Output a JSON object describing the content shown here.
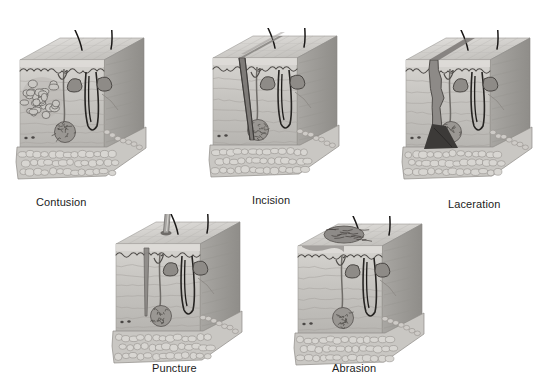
{
  "figure": {
    "background_color": "#ffffff",
    "style": "grayscale medical illustration",
    "palette": {
      "epidermis_top": "#d2d0cd",
      "epidermis_shadow": "#b4b2af",
      "dermis_light": "#cdcbc7",
      "dermis_mid": "#bab8b4",
      "dermis_dark": "#a3a09c",
      "hypodermis": "#c9c7c3",
      "hypodermis_outline": "#8e8b87",
      "hair_dark": "#222222",
      "gland_dark": "#6f6c68",
      "wound_dark": "#4a4745",
      "nail_metal": "#a8a6a3",
      "label_text": "#1c1c1c"
    }
  },
  "wounds": [
    {
      "id": "contusion",
      "label": "Contusion",
      "row": 1,
      "column": 1,
      "block_x": 12,
      "block_y": 30,
      "label_x": 36,
      "label_y": 196,
      "wound_feature": "bruise",
      "description": "Cluster of pooled blood cells beneath intact skin surface",
      "surface_broken": false
    },
    {
      "id": "incision",
      "label": "Incision",
      "row": 1,
      "column": 2,
      "block_x": 205,
      "block_y": 28,
      "label_x": 252,
      "label_y": 194,
      "wound_feature": "clean-straight-cut",
      "description": "Clean straight-edged diagonal cut through epidermis and dermis",
      "surface_broken": true
    },
    {
      "id": "laceration",
      "label": "Laceration",
      "row": 1,
      "column": 3,
      "block_x": 398,
      "block_y": 30,
      "label_x": 448,
      "label_y": 198,
      "wound_feature": "jagged-tear",
      "description": "Jagged irregular tear widening into a dark flared base",
      "surface_broken": true
    },
    {
      "id": "puncture",
      "label": "Puncture",
      "row": 2,
      "column": 1,
      "block_x": 108,
      "block_y": 214,
      "label_x": 152,
      "label_y": 362,
      "wound_feature": "nail-penetration",
      "description": "Nail with flat head driven deep through the skin layers",
      "surface_broken": true,
      "object": "nail"
    },
    {
      "id": "abrasion",
      "label": "Abrasion",
      "row": 2,
      "column": 2,
      "block_x": 290,
      "block_y": 216,
      "label_x": 332,
      "label_y": 362,
      "wound_feature": "surface-scrape",
      "description": "Scraped roughened patch removing the superficial epidermis",
      "surface_broken": true
    }
  ],
  "skin_anatomy": {
    "layers": [
      "epidermis",
      "dermis",
      "hypodermis"
    ],
    "structures": [
      "hair shaft",
      "hair follicle",
      "sebaceous gland",
      "sweat gland",
      "blood vessel",
      "pore"
    ]
  }
}
